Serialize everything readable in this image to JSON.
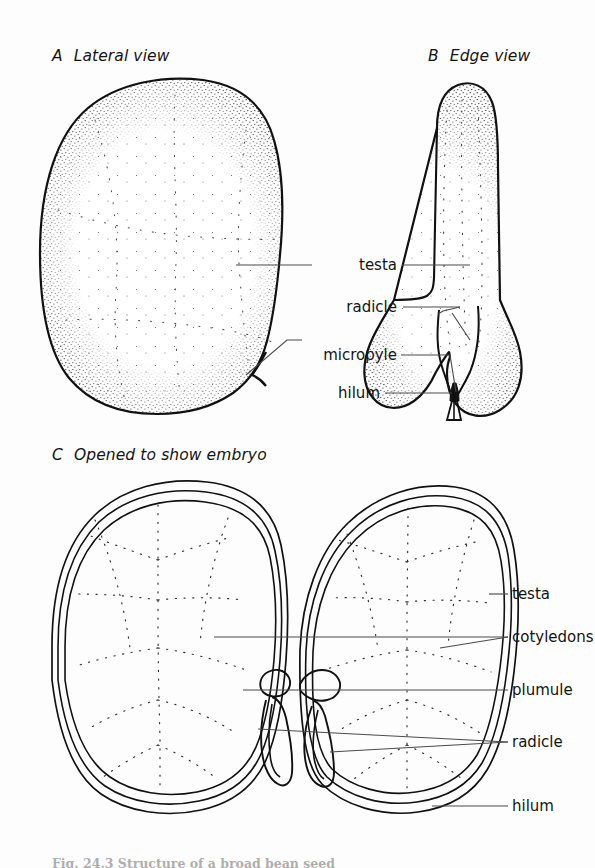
{
  "figure": {
    "background_color": "#fdfdfd",
    "ink_color": "#111111",
    "leader_color": "#4a4a4a",
    "panels": [
      {
        "tag": "A",
        "title": "Lateral view"
      },
      {
        "tag": "B",
        "title": "Edge view"
      },
      {
        "tag": "C",
        "title": "Opened to show embryo"
      }
    ]
  },
  "labels_top": {
    "testa": "testa",
    "radicle": "radicle",
    "micropyle": "micropyle",
    "hilum": "hilum"
  },
  "labels_bottom": {
    "testa": "testa",
    "cotyledons": "cotyledons",
    "plumule": "plumule",
    "radicle": "radicle",
    "hilum": "hilum"
  },
  "caption": {
    "text": "Fig. 24.3  Structure of a broad bean seed"
  }
}
